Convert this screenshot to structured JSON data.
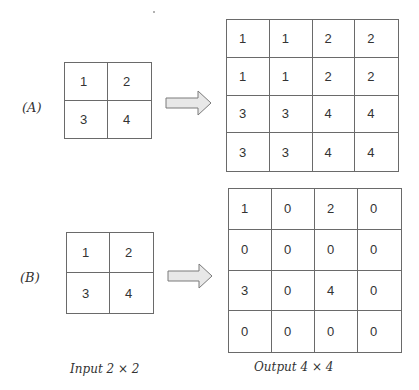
{
  "panels": [
    {
      "label": "(A)",
      "input": [
        [
          "1",
          "2"
        ],
        [
          "3",
          "4"
        ]
      ],
      "output": [
        [
          "1",
          "1",
          "2",
          "2"
        ],
        [
          "1",
          "1",
          "2",
          "2"
        ],
        [
          "3",
          "3",
          "4",
          "4"
        ],
        [
          "3",
          "3",
          "4",
          "4"
        ]
      ]
    },
    {
      "label": "(B)",
      "input": [
        [
          "1",
          "2"
        ],
        [
          "3",
          "4"
        ]
      ],
      "output": [
        [
          "1",
          "0",
          "2",
          "0"
        ],
        [
          "0",
          "0",
          "0",
          "0"
        ],
        [
          "3",
          "0",
          "4",
          "0"
        ],
        [
          "0",
          "0",
          "0",
          "0"
        ]
      ]
    }
  ],
  "captions": {
    "input": "Input 2 × 2",
    "output": "Output 4 × 4"
  },
  "colors": {
    "arrow_fill": "#e8e8e8",
    "arrow_stroke": "#7a7a7a",
    "grid_line": "#6a6a6a"
  }
}
